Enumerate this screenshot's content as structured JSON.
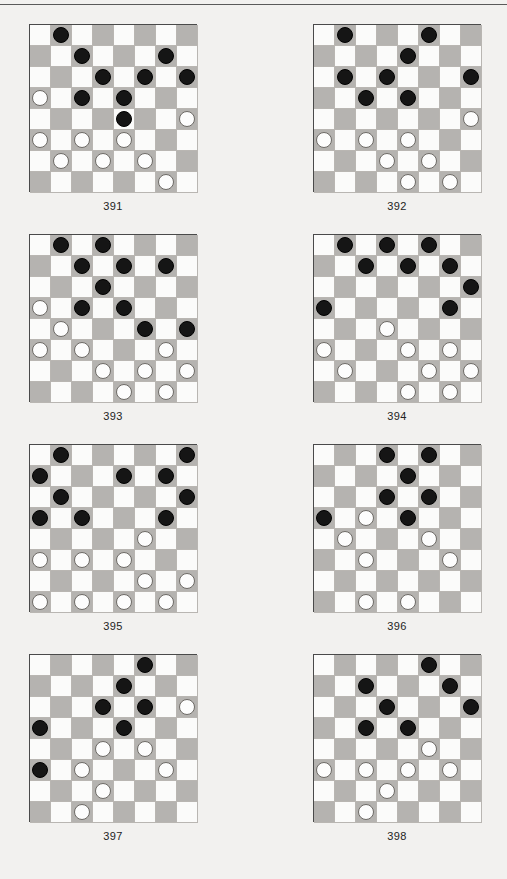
{
  "page": {
    "background_color": "#f2f1ef",
    "rule_color": "#5a5a5a",
    "width": 507,
    "height": 879
  },
  "board_style": {
    "size": 8,
    "light_square_color": "#fbfbfa",
    "dark_square_color": "#b5b3b0",
    "grid_line_color": "#b9b6b2",
    "border_color": "#4a4a4a",
    "black_piece_color": "#151515",
    "white_piece_color": "#fdfdfd",
    "white_piece_border": "#6d6a66",
    "dark_square_parity": "odd"
  },
  "diagrams": [
    {
      "label": "391",
      "position": {
        "left": 29,
        "top": 24
      },
      "black": [
        [
          0,
          1
        ],
        [
          1,
          2
        ],
        [
          1,
          6
        ],
        [
          2,
          3
        ],
        [
          2,
          5
        ],
        [
          2,
          7
        ],
        [
          3,
          2
        ],
        [
          3,
          4
        ],
        [
          4,
          4
        ]
      ],
      "white": [
        [
          3,
          0
        ],
        [
          4,
          7
        ],
        [
          5,
          0
        ],
        [
          5,
          2
        ],
        [
          5,
          4
        ],
        [
          6,
          1
        ],
        [
          6,
          3
        ],
        [
          6,
          5
        ],
        [
          7,
          6
        ]
      ],
      "black_count": 9,
      "white_count": 9
    },
    {
      "label": "392",
      "position": {
        "left": 313,
        "top": 24
      },
      "black": [
        [
          0,
          1
        ],
        [
          0,
          5
        ],
        [
          1,
          4
        ],
        [
          2,
          1
        ],
        [
          2,
          3
        ],
        [
          2,
          7
        ],
        [
          3,
          2
        ],
        [
          3,
          4
        ]
      ],
      "white": [
        [
          4,
          7
        ],
        [
          5,
          0
        ],
        [
          5,
          2
        ],
        [
          5,
          4
        ],
        [
          6,
          3
        ],
        [
          6,
          5
        ],
        [
          7,
          4
        ],
        [
          7,
          6
        ]
      ],
      "black_count": 8,
      "white_count": 8
    },
    {
      "label": "393",
      "position": {
        "left": 29,
        "top": 234
      },
      "black": [
        [
          0,
          1
        ],
        [
          0,
          3
        ],
        [
          1,
          2
        ],
        [
          1,
          4
        ],
        [
          1,
          6
        ],
        [
          2,
          3
        ],
        [
          3,
          2
        ],
        [
          3,
          4
        ],
        [
          4,
          5
        ],
        [
          4,
          7
        ]
      ],
      "white": [
        [
          3,
          0
        ],
        [
          4,
          1
        ],
        [
          5,
          0
        ],
        [
          5,
          2
        ],
        [
          5,
          6
        ],
        [
          6,
          3
        ],
        [
          6,
          5
        ],
        [
          6,
          7
        ],
        [
          7,
          4
        ],
        [
          7,
          6
        ]
      ],
      "black_count": 10,
      "white_count": 10
    },
    {
      "label": "394",
      "position": {
        "left": 313,
        "top": 234
      },
      "black": [
        [
          0,
          1
        ],
        [
          0,
          3
        ],
        [
          0,
          5
        ],
        [
          1,
          2
        ],
        [
          1,
          4
        ],
        [
          1,
          6
        ],
        [
          2,
          7
        ],
        [
          3,
          0
        ],
        [
          3,
          6
        ]
      ],
      "white": [
        [
          4,
          3
        ],
        [
          5,
          0
        ],
        [
          5,
          4
        ],
        [
          5,
          6
        ],
        [
          6,
          1
        ],
        [
          6,
          5
        ],
        [
          6,
          7
        ],
        [
          7,
          4
        ],
        [
          7,
          6
        ]
      ],
      "black_count": 9,
      "white_count": 9
    },
    {
      "label": "395",
      "position": {
        "left": 29,
        "top": 444
      },
      "black": [
        [
          0,
          1
        ],
        [
          0,
          7
        ],
        [
          1,
          0
        ],
        [
          1,
          4
        ],
        [
          1,
          6
        ],
        [
          2,
          1
        ],
        [
          2,
          7
        ],
        [
          3,
          0
        ],
        [
          3,
          2
        ],
        [
          3,
          6
        ]
      ],
      "white": [
        [
          4,
          5
        ],
        [
          5,
          0
        ],
        [
          5,
          2
        ],
        [
          5,
          4
        ],
        [
          6,
          5
        ],
        [
          6,
          7
        ],
        [
          7,
          0
        ],
        [
          7,
          2
        ],
        [
          7,
          4
        ],
        [
          7,
          6
        ]
      ],
      "black_count": 10,
      "white_count": 10
    },
    {
      "label": "396",
      "position": {
        "left": 313,
        "top": 444
      },
      "black": [
        [
          0,
          3
        ],
        [
          0,
          5
        ],
        [
          1,
          4
        ],
        [
          2,
          3
        ],
        [
          2,
          5
        ],
        [
          3,
          0
        ],
        [
          3,
          4
        ]
      ],
      "white": [
        [
          3,
          2
        ],
        [
          4,
          1
        ],
        [
          4,
          5
        ],
        [
          5,
          2
        ],
        [
          5,
          6
        ],
        [
          7,
          2
        ],
        [
          7,
          4
        ]
      ],
      "black_count": 7,
      "white_count": 7
    },
    {
      "label": "397",
      "position": {
        "left": 29,
        "top": 654
      },
      "black": [
        [
          0,
          5
        ],
        [
          1,
          4
        ],
        [
          2,
          3
        ],
        [
          2,
          5
        ],
        [
          3,
          0
        ],
        [
          3,
          4
        ],
        [
          5,
          0
        ]
      ],
      "white": [
        [
          2,
          7
        ],
        [
          4,
          3
        ],
        [
          4,
          5
        ],
        [
          5,
          2
        ],
        [
          5,
          6
        ],
        [
          6,
          3
        ],
        [
          7,
          2
        ]
      ],
      "black_count": 7,
      "white_count": 7
    },
    {
      "label": "398",
      "position": {
        "left": 313,
        "top": 654
      },
      "black": [
        [
          0,
          5
        ],
        [
          1,
          2
        ],
        [
          1,
          6
        ],
        [
          2,
          3
        ],
        [
          2,
          7
        ],
        [
          3,
          2
        ],
        [
          3,
          4
        ]
      ],
      "white": [
        [
          4,
          5
        ],
        [
          5,
          0
        ],
        [
          5,
          2
        ],
        [
          5,
          4
        ],
        [
          5,
          6
        ],
        [
          6,
          3
        ],
        [
          7,
          2
        ]
      ],
      "black_count": 7,
      "white_count": 7
    }
  ]
}
